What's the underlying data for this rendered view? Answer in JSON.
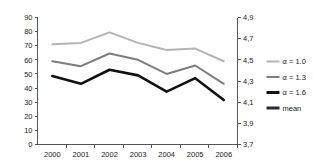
{
  "chart_data": {
    "type": "line",
    "title": "",
    "subtitle": "",
    "xlabel": "",
    "ylabel": "",
    "categories": [
      "2000",
      "2001",
      "2002",
      "2003",
      "2004",
      "2005",
      "2006"
    ],
    "x_tick_labels": [
      "2000",
      "2001",
      "2002",
      "2003",
      "2004",
      "2005",
      "2006"
    ],
    "y_tick_labels_left": [
      "0",
      "10",
      "20",
      "30",
      "40",
      "50",
      "60",
      "70",
      "80",
      "90"
    ],
    "y_tick_labels_right": [
      "3,7",
      "3,9",
      "4,1",
      "4,3",
      "4,5",
      "4,7",
      "4,9"
    ],
    "ylim": [
      0,
      90
    ],
    "ylim_right": [
      3.7,
      4.9
    ],
    "grid": false,
    "legend_position": "right",
    "series": [
      {
        "name": "a = 1.0",
        "axis": "left",
        "color": "#b4b4b4",
        "width": 2.0,
        "values": [
          71,
          72,
          79.5,
          72,
          67,
          68,
          59
        ]
      },
      {
        "name": "a = 1.3",
        "axis": "left",
        "color": "#7d7d7d",
        "width": 2.0,
        "values": [
          59,
          55.5,
          64.5,
          60,
          50,
          56,
          43
        ]
      },
      {
        "name": "a = 1.6",
        "axis": "left",
        "color": "#111111",
        "width": 2.6,
        "values": [
          48.5,
          43,
          53,
          49,
          37.5,
          47,
          31.5
        ]
      },
      {
        "name": "mean",
        "axis": "right",
        "color": "#2b2b2b",
        "width": 2.6,
        "values": [
          21,
          28,
          21,
          20.5,
          10,
          13.5,
          8
        ]
      }
    ]
  },
  "legend": {
    "items": [
      {
        "label": "α = 1.0",
        "color": "#b4b4b4",
        "width": 2.0
      },
      {
        "label": "α = 1.3",
        "color": "#7d7d7d",
        "width": 2.0
      },
      {
        "label": "α = 1.6",
        "color": "#111111",
        "width": 3.0
      },
      {
        "label": "mean",
        "color": "#2b2b2b",
        "width": 3.0
      }
    ]
  },
  "axes": {
    "left_ticks": [
      "90",
      "80",
      "70",
      "60",
      "50",
      "40",
      "30",
      "20",
      "10",
      "0"
    ],
    "right_ticks": [
      "4,9",
      "4,7",
      "4,5",
      "4,3",
      "4,1",
      "3,9",
      "3,7"
    ],
    "x_ticks": [
      "2000",
      "2001",
      "2002",
      "2003",
      "2004",
      "2005",
      "2006"
    ],
    "axis_color": "#555555"
  }
}
